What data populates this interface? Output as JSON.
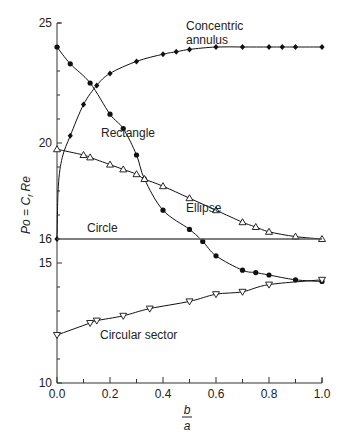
{
  "chart_data": {
    "type": "line",
    "title": "",
    "xlabel": "b/a",
    "xlabel_num": "b",
    "xlabel_den": "a",
    "ylabel": "Po = C_f Re",
    "ylabel_parts": {
      "po": "Po = C",
      "sub": "f",
      "re": " Re"
    },
    "xlim": [
      0.0,
      1.0
    ],
    "ylim": [
      10,
      25
    ],
    "xticks": [
      0.0,
      0.2,
      0.4,
      0.6,
      0.8,
      1.0
    ],
    "xtick_labels": [
      "0.0",
      "0.2",
      "0.4",
      "0.6",
      "0.8",
      "1.0"
    ],
    "yticks_major": [
      10,
      15,
      16,
      20,
      25
    ],
    "ytick_labels": [
      "10",
      "15",
      "16",
      "20",
      "25"
    ],
    "grid": false,
    "legend": "inline labels",
    "series": [
      {
        "name": "Concentric annulus",
        "label_lines": [
          "Concentric",
          "annulus"
        ],
        "marker": "filled-diamond",
        "x": [
          0.0,
          0.05,
          0.1,
          0.15,
          0.2,
          0.3,
          0.4,
          0.45,
          0.5,
          0.6,
          0.7,
          0.8,
          0.85,
          0.9,
          1.0
        ],
        "values": [
          16.0,
          20.3,
          21.6,
          22.4,
          22.9,
          23.4,
          23.7,
          23.8,
          23.9,
          24.0,
          24.0,
          24.0,
          24.0,
          24.0,
          24.0
        ]
      },
      {
        "name": "Rectangle",
        "marker": "filled-circle",
        "x": [
          0.0,
          0.05,
          0.125,
          0.2,
          0.25,
          0.3,
          0.33,
          0.4,
          0.5,
          0.55,
          0.6,
          0.7,
          0.75,
          0.8,
          0.9,
          1.0
        ],
        "values": [
          24.0,
          23.3,
          22.5,
          21.2,
          20.6,
          19.5,
          18.5,
          17.2,
          16.4,
          15.9,
          15.3,
          14.7,
          14.6,
          14.5,
          14.3,
          14.23
        ]
      },
      {
        "name": "Ellipse",
        "marker": "open-triangle-up",
        "x": [
          0.0,
          0.1,
          0.125,
          0.2,
          0.25,
          0.3,
          0.33,
          0.4,
          0.5,
          0.6,
          0.7,
          0.75,
          0.8,
          0.9,
          1.0
        ],
        "values": [
          19.74,
          19.5,
          19.4,
          19.1,
          18.9,
          18.7,
          18.5,
          18.2,
          17.7,
          17.2,
          16.7,
          16.5,
          16.3,
          16.1,
          16.0
        ]
      },
      {
        "name": "Circle",
        "marker": "none",
        "x": [
          0.0,
          1.0
        ],
        "values": [
          16.0,
          16.0
        ]
      },
      {
        "name": "Circular sector",
        "marker": "open-triangle-down",
        "x": [
          0.0,
          0.125,
          0.15,
          0.25,
          0.35,
          0.5,
          0.6,
          0.7,
          0.8,
          1.0
        ],
        "values": [
          12.0,
          12.5,
          12.6,
          12.8,
          13.1,
          13.4,
          13.7,
          13.8,
          14.1,
          14.3
        ]
      }
    ]
  }
}
